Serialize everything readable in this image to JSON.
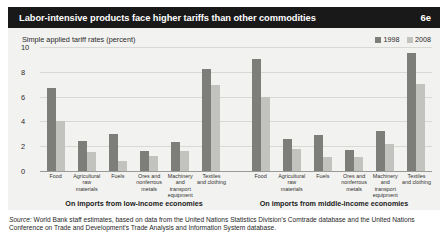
{
  "header": {
    "title": "Labor-intensive products face higher tariffs than other commodities",
    "figure_number": "6e"
  },
  "chart_data": {
    "type": "bar",
    "title": "Labor-intensive products face higher tariffs than other commodities",
    "ylabel": "Simple applied tariff rates (percent)",
    "xlabel": "",
    "ylim": [
      0,
      10
    ],
    "yticks": [
      "0",
      "2",
      "4",
      "6",
      "8",
      "10"
    ],
    "grid": true,
    "legend_position": "top-right",
    "legend": [
      "1998",
      "2008"
    ],
    "colors": {
      "series_1998": "#7d7d79",
      "series_2008": "#c2c2be",
      "title_bar": "#191919",
      "plot_background": "#f2f2f0",
      "gridline": "#d8d8d4"
    },
    "categories": [
      "Food",
      "Agricultural raw materials",
      "Fuels",
      "Ores and nonferrous metals",
      "Machinery and transport equipment",
      "Textiles and clothing"
    ],
    "panels": [
      {
        "caption": "On imports from low-income economies",
        "series": [
          {
            "name": "1998",
            "values": [
              6.7,
              2.4,
              3.0,
              1.6,
              2.3,
              8.2
            ]
          },
          {
            "name": "2008",
            "values": [
              4.0,
              1.5,
              0.8,
              1.2,
              1.6,
              6.9
            ]
          }
        ]
      },
      {
        "caption": "On imports from middle-income economies",
        "series": [
          {
            "name": "1998",
            "values": [
              9.0,
              2.6,
              2.9,
              1.7,
              3.2,
              9.5
            ]
          },
          {
            "name": "2008",
            "values": [
              6.0,
              1.8,
              1.1,
              1.1,
              2.2,
              7.0
            ]
          }
        ]
      }
    ]
  },
  "category_labels": [
    [
      "Food"
    ],
    [
      "Agricultural",
      "raw materials"
    ],
    [
      "Fuels"
    ],
    [
      "Ores and",
      "nonferrous",
      "metals"
    ],
    [
      "Machinery",
      "and",
      "transport",
      "equipment"
    ],
    [
      "Textiles",
      "and clothing"
    ]
  ],
  "source": {
    "lead": "Source:",
    "text": " World Bank staff estimates, based on data from the United Nations Statistics Division's Comtrade database and the United Nations Conference on Trade and Development's Trade Analysis and Information System database."
  }
}
